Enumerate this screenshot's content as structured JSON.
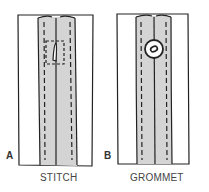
{
  "figure": {
    "panels": [
      {
        "letter": "A",
        "caption": "STITCH"
      },
      {
        "letter": "B",
        "caption": "GROMMET"
      }
    ],
    "colors": {
      "line": "#222222",
      "fill": "#d4d4d4",
      "background": "#ffffff"
    }
  }
}
